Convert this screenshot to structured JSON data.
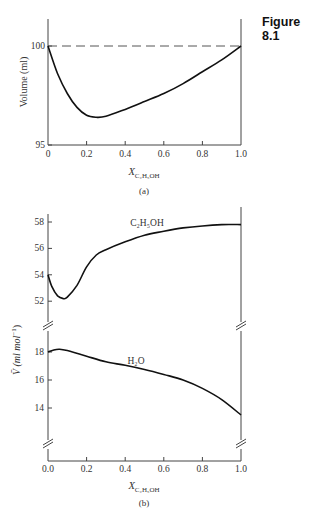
{
  "figure_label": "Figure 8.1",
  "chart_data": [
    {
      "type": "line",
      "panel_label": "(a)",
      "title": "",
      "xlabel": "X_C2H5OH",
      "xlabel_main": "X",
      "xlabel_sub": "C₂H₅OH",
      "ylabel": "Volume (ml)",
      "xlim": [
        0,
        1.0
      ],
      "ylim": [
        95,
        101.3
      ],
      "x_ticks": [
        "0",
        "0.2",
        "0.4",
        "0.6",
        "0.8",
        "1.0"
      ],
      "y_ticks": [
        "95",
        "100"
      ],
      "grid": false,
      "series": [
        {
          "name": "Total volume",
          "style": "solid",
          "x": [
            0,
            0.05,
            0.1,
            0.15,
            0.2,
            0.25,
            0.3,
            0.4,
            0.5,
            0.6,
            0.7,
            0.8,
            0.9,
            1.0
          ],
          "values": [
            100,
            98.6,
            97.6,
            96.9,
            96.5,
            96.4,
            96.45,
            96.8,
            97.2,
            97.6,
            98.1,
            98.7,
            99.3,
            100
          ]
        },
        {
          "name": "Ideal (additive) volume",
          "style": "dashed",
          "x": [
            0,
            1.0
          ],
          "values": [
            100,
            100
          ]
        }
      ]
    },
    {
      "type": "line",
      "panel_label": "(b)",
      "title": "",
      "xlabel": "X_C2H5OH",
      "xlabel_main": "X",
      "xlabel_sub": "C₂H₅OH",
      "ylabel": "V̄ (ml mol⁻¹)",
      "ylabel_main": "V̄ (ml mol",
      "ylabel_sup": "−1",
      "ylabel_close": ")",
      "xlim": [
        0,
        1.0
      ],
      "y_axis_broken": true,
      "upper_ylim": [
        50.5,
        58.5
      ],
      "lower_ylim": [
        12,
        19
      ],
      "x_ticks": [
        "0.0",
        "0.2",
        "0.4",
        "0.6",
        "0.8",
        "1.0"
      ],
      "y_ticks_upper": [
        "52",
        "54",
        "56",
        "58"
      ],
      "y_ticks_lower": [
        "14",
        "16",
        "18"
      ],
      "grid": false,
      "series": [
        {
          "name": "C₂H₅OH",
          "label": "C₂H₅OH",
          "x": [
            0,
            0.02,
            0.05,
            0.08,
            0.1,
            0.15,
            0.2,
            0.25,
            0.3,
            0.4,
            0.5,
            0.6,
            0.7,
            0.8,
            0.9,
            1.0
          ],
          "values": [
            54.0,
            53.1,
            52.4,
            52.2,
            52.3,
            53.2,
            54.6,
            55.5,
            55.9,
            56.5,
            57.0,
            57.3,
            57.55,
            57.7,
            57.8,
            57.8
          ]
        },
        {
          "name": "H₂O",
          "label": "H₂O",
          "x": [
            0,
            0.03,
            0.06,
            0.1,
            0.2,
            0.3,
            0.4,
            0.5,
            0.6,
            0.7,
            0.8,
            0.9,
            1.0
          ],
          "values": [
            18.0,
            18.15,
            18.2,
            18.1,
            17.7,
            17.3,
            17.05,
            16.75,
            16.4,
            16.0,
            15.4,
            14.6,
            13.5
          ]
        }
      ]
    }
  ]
}
